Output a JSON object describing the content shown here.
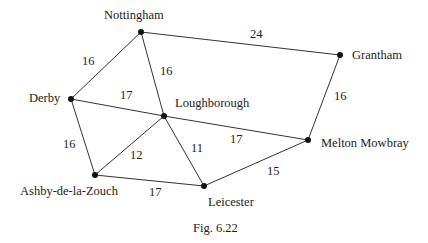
{
  "figure": {
    "caption": "Fig. 6.22",
    "nodes": [
      {
        "id": "nottingham",
        "label": "Nottingham",
        "x": 141,
        "y": 32,
        "lx": 104,
        "ly": 9
      },
      {
        "id": "grantham",
        "label": "Grantham",
        "x": 340,
        "y": 55,
        "lx": 352,
        "ly": 49
      },
      {
        "id": "derby",
        "label": "Derby",
        "x": 71,
        "y": 99,
        "lx": 29,
        "ly": 92
      },
      {
        "id": "loughborough",
        "label": "Loughborough",
        "x": 164,
        "y": 116,
        "lx": 175,
        "ly": 97
      },
      {
        "id": "melton",
        "label": "Melton Mowbray",
        "x": 308,
        "y": 140,
        "lx": 321,
        "ly": 137
      },
      {
        "id": "ashby",
        "label": "Ashby-de-la-Zouch",
        "x": 95,
        "y": 175,
        "lx": 20,
        "ly": 185
      },
      {
        "id": "leicester",
        "label": "Leicester",
        "x": 204,
        "y": 186,
        "lx": 208,
        "ly": 196
      }
    ],
    "edges": [
      {
        "from": "nottingham",
        "to": "grantham",
        "weight": "24",
        "wx": 250,
        "wy": 28
      },
      {
        "from": "nottingham",
        "to": "derby",
        "weight": "16",
        "wx": 82,
        "wy": 55
      },
      {
        "from": "nottingham",
        "to": "loughborough",
        "weight": "16",
        "wx": 160,
        "wy": 65
      },
      {
        "from": "derby",
        "to": "loughborough",
        "weight": "17",
        "wx": 120,
        "wy": 89
      },
      {
        "from": "grantham",
        "to": "melton",
        "weight": "16",
        "wx": 334,
        "wy": 90
      },
      {
        "from": "derby",
        "to": "ashby",
        "weight": "16",
        "wx": 63,
        "wy": 138
      },
      {
        "from": "loughborough",
        "to": "ashby",
        "weight": "12",
        "wx": 130,
        "wy": 149
      },
      {
        "from": "loughborough",
        "to": "leicester",
        "weight": "11",
        "wx": 191,
        "wy": 142
      },
      {
        "from": "loughborough",
        "to": "melton",
        "weight": "17",
        "wx": 230,
        "wy": 133
      },
      {
        "from": "ashby",
        "to": "leicester",
        "weight": "17",
        "wx": 149,
        "wy": 186
      },
      {
        "from": "leicester",
        "to": "melton",
        "weight": "15",
        "wx": 267,
        "wy": 165
      }
    ]
  }
}
